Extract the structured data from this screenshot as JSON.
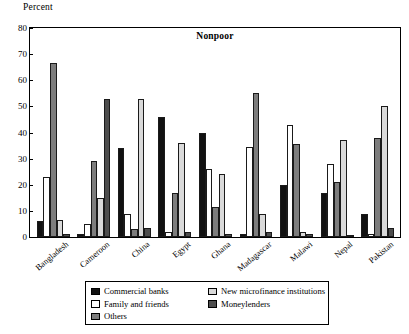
{
  "axis": {
    "unit_label": "Percent",
    "yticks": [
      0,
      10,
      20,
      30,
      40,
      50,
      60,
      70,
      80
    ],
    "ymin": 0,
    "ymax": 80
  },
  "legend": {
    "items": [
      {
        "label": "Commercial banks",
        "key": "commercial",
        "color": "#111111"
      },
      {
        "label": "Family and friends",
        "key": "family",
        "color": "#ffffff"
      },
      {
        "label": "Others",
        "key": "others",
        "color": "#7d7d7d"
      },
      {
        "label": "New microfinance institutions",
        "key": "newmfi",
        "color": "#d9d9d9"
      },
      {
        "label": "Moneylenders",
        "key": "money",
        "color": "#4d4d4d"
      }
    ]
  },
  "chart_data": {
    "type": "bar",
    "title": "Nonpoor",
    "xlabel": "",
    "ylabel": "Percent",
    "ylim": [
      0,
      80
    ],
    "ytick_step": 10,
    "grid": false,
    "legend_position": "bottom",
    "categories": [
      "Bangladesh",
      "Cameroon",
      "China",
      "Egypt",
      "Ghana",
      "Madagascar",
      "Malawi",
      "Nepal",
      "Pakistan"
    ],
    "series": [
      {
        "name": "Commercial banks",
        "color": "#111111",
        "values": [
          6,
          1,
          34,
          46,
          40,
          1,
          20,
          17,
          9
        ]
      },
      {
        "name": "Family and friends",
        "color": "#ffffff",
        "values": [
          23,
          5,
          9,
          2,
          26,
          34.5,
          43,
          28,
          1
        ]
      },
      {
        "name": "Others",
        "color": "#7d7d7d",
        "values": [
          66.5,
          29,
          3,
          17,
          11.5,
          55,
          35.5,
          21,
          38
        ]
      },
      {
        "name": "New microfinance institutions",
        "color": "#d9d9d9",
        "values": [
          6.5,
          15,
          53,
          36,
          24,
          9,
          2,
          37,
          50
        ]
      },
      {
        "name": "Moneylenders",
        "color": "#4d4d4d",
        "values": [
          1,
          53,
          3.5,
          2,
          1,
          2,
          1,
          0.5,
          3.5
        ]
      }
    ]
  }
}
